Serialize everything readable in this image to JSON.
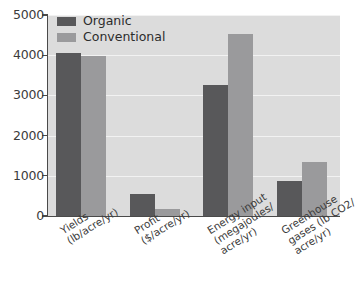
{
  "chart_data": {
    "type": "bar",
    "title": "",
    "subtitle": "",
    "xlabel": "",
    "ylabel": "",
    "ylim": [
      0,
      5000
    ],
    "grid": true,
    "legend_position": "top-left",
    "categories": [
      "Yields\n(lb/acre/yr)",
      "Profit\n($/acre/yr)",
      "Energy input\n(megajoules/\nacre/yr)",
      "Greenhouse\ngases (lb CO2/\nacre/yr)"
    ],
    "series": [
      {
        "name": "Organic",
        "color": "#58585a",
        "values": [
          4060,
          550,
          3270,
          870
        ]
      },
      {
        "name": "Conventional",
        "color": "#9a9a9c",
        "values": [
          3990,
          180,
          4520,
          1340
        ]
      }
    ],
    "y_ticks": [
      0,
      1000,
      2000,
      3000,
      4000,
      5000
    ],
    "y_tick_labels": [
      "0",
      "1000",
      "2000",
      "3000",
      "4000",
      "5000"
    ]
  },
  "legend": {
    "items": [
      {
        "label": "Organic",
        "color": "#58585a"
      },
      {
        "label": "Conventional",
        "color": "#9a9a9c"
      }
    ]
  },
  "categories_lines": [
    [
      "Yields",
      "(lb/acre/yr)"
    ],
    [
      "Profit",
      "($/acre/yr)"
    ],
    [
      "Energy input",
      "(megajoules/",
      "acre/yr)"
    ],
    [
      "Greenhouse",
      "gases (lb CO2/",
      "acre/yr)"
    ]
  ],
  "colors": {
    "plot_background": "#dcdcdc",
    "gridline": "#f2f2f2",
    "axis": "#4a4a4a",
    "organic": "#58585a",
    "conventional": "#9a9a9c",
    "page_background": "#ffffff"
  }
}
